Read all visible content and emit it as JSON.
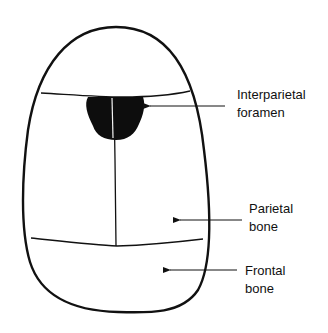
{
  "diagram": {
    "colors": {
      "background": "#ffffff",
      "stroke": "#111111",
      "foramen_fill": "#0d0d0d"
    },
    "labels": [
      {
        "id": "interparietal-foramen",
        "lines": [
          "Interparietal",
          "foramen"
        ]
      },
      {
        "id": "parietal-bone",
        "lines": [
          "Parietal",
          "bone"
        ]
      },
      {
        "id": "frontal-bone",
        "lines": [
          "Frontal",
          "bone"
        ]
      }
    ]
  }
}
